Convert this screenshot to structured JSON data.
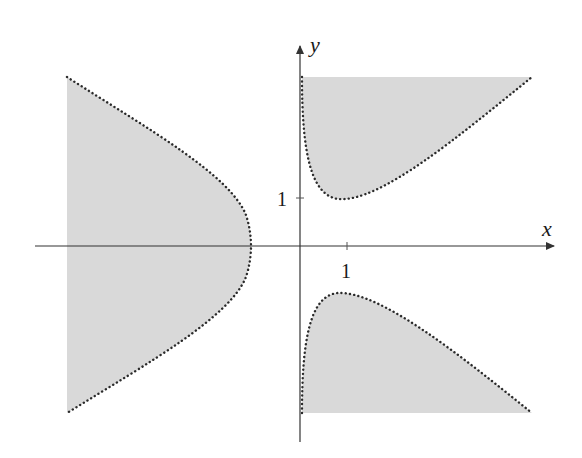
{
  "diagram": {
    "axes": {
      "x_label": "x",
      "y_label": "y",
      "x_tick_label": "1",
      "y_tick_label": "1"
    },
    "colors": {
      "fill": "#d9d9d9",
      "boundary": "#2a2a2a",
      "axis": "#333333"
    },
    "regions": [
      {
        "name": "left-region",
        "description": "Shaded region left of the y-axis bounded by a dotted curve with vertex near x = -1 on the x-axis"
      },
      {
        "name": "upper-right-region",
        "description": "Shaded region in the first quadrant above a dotted curve with minimum near (0.8, 1)"
      },
      {
        "name": "lower-right-region",
        "description": "Shaded region in the fourth quadrant below a dotted curve with maximum near (0.8, -1)"
      }
    ],
    "boundary_style": "dotted"
  }
}
